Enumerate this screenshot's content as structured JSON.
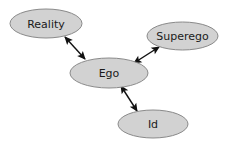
{
  "diagram": {
    "background_color": "#ffffff",
    "node_fill_color": "#d2d2d2",
    "node_stroke_color": "#8a8a8a",
    "edge_color": "#111111",
    "label_color": "#1a1a1a",
    "nodes": [
      {
        "id": "reality",
        "label": "Reality",
        "cx": 46,
        "cy": 23.5,
        "rx": 36,
        "ry": 14.5,
        "font_size": 11
      },
      {
        "id": "superego",
        "label": "Superego",
        "cx": 182.5,
        "cy": 36,
        "rx": 35.5,
        "ry": 14,
        "font_size": 11
      },
      {
        "id": "ego",
        "label": "Ego",
        "cx": 109,
        "cy": 73,
        "rx": 39,
        "ry": 15,
        "font_size": 11
      },
      {
        "id": "id",
        "label": "Id",
        "cx": 153,
        "cy": 124,
        "rx": 35,
        "ry": 14,
        "font_size": 11
      }
    ],
    "edges": [
      {
        "id": "reality-ego",
        "from": "reality",
        "to": "ego",
        "arrowheads": "both",
        "x1": 65,
        "y1": 37,
        "x2": 85,
        "y2": 59
      },
      {
        "id": "ego-superego",
        "from": "ego",
        "to": "superego",
        "arrowheads": "both",
        "x1": 134,
        "y1": 63,
        "x2": 159,
        "y2": 47
      },
      {
        "id": "ego-id",
        "from": "ego",
        "to": "id",
        "arrowheads": "both",
        "x1": 121,
        "y1": 86,
        "x2": 137,
        "y2": 111
      }
    ]
  }
}
